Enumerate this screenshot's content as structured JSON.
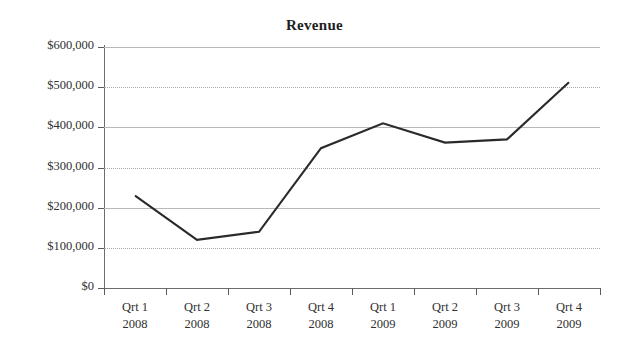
{
  "chart_data": {
    "type": "line",
    "title": "Revenue",
    "xlabel": "",
    "ylabel": "",
    "categories": [
      "Qrt 1 2008",
      "Qrt 2 2008",
      "Qrt 3 2008",
      "Qrt 4 2008",
      "Qrt 1 2009",
      "Qrt 2 2009",
      "Qrt 3 2009",
      "Qrt 4 2009"
    ],
    "category_lines": [
      {
        "quarter": "Qrt 1",
        "year": "2008"
      },
      {
        "quarter": "Qrt 2",
        "year": "2008"
      },
      {
        "quarter": "Qrt 3",
        "year": "2008"
      },
      {
        "quarter": "Qrt 4",
        "year": "2008"
      },
      {
        "quarter": "Qrt 1",
        "year": "2009"
      },
      {
        "quarter": "Qrt 2",
        "year": "2009"
      },
      {
        "quarter": "Qrt 3",
        "year": "2009"
      },
      {
        "quarter": "Qrt 4",
        "year": "2009"
      }
    ],
    "values": [
      230000,
      120000,
      140000,
      348000,
      410000,
      362000,
      370000,
      512000
    ],
    "series": [
      {
        "name": "Revenue",
        "values": [
          230000,
          120000,
          140000,
          348000,
          410000,
          362000,
          370000,
          512000
        ]
      }
    ],
    "ylim": [
      0,
      600000
    ],
    "ytick_values": [
      600000,
      500000,
      400000,
      300000,
      200000,
      100000,
      0
    ],
    "ytick_labels": [
      "$600,000",
      "$500,000",
      "$400,000",
      "$300,000",
      "$200,000",
      "$100,000",
      "$0"
    ],
    "grid": true,
    "grid_axis": "y",
    "legend": false,
    "legend_position": "none",
    "line_color": "#2a2a2a",
    "grid_color": "#b9b9b9",
    "axis_color": "#6d6d6d",
    "background_color": "#ffffff",
    "markers": false
  }
}
